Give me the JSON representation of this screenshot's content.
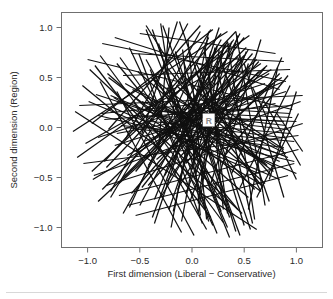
{
  "figure": {
    "background_color": "#ffffff",
    "line_color": "#101010",
    "frame_color": "#6f6f6f",
    "label_color": "#2b2b2b",
    "point_label_color": "#8d8d8d"
  },
  "chart_data": {
    "type": "line",
    "title": "",
    "subtitle": "",
    "xlabel": "First dimension (Liberal − Conservative)",
    "ylabel": "Second dimension (Region)",
    "xlim": [
      -1.25,
      1.25
    ],
    "ylim": [
      -1.2,
      1.15
    ],
    "xticks": [
      -1.0,
      -0.5,
      0.0,
      0.5,
      1.0
    ],
    "xticklabels": [
      "−1.0",
      "−0.5",
      "0.0",
      "0.5",
      "1.0"
    ],
    "yticks": [
      -1.0,
      -0.5,
      0.0,
      0.5,
      1.0
    ],
    "yticklabels": [
      "−1.0",
      "−0.5",
      "0.0",
      "0.5",
      "1.0"
    ],
    "grid": false,
    "legend": false,
    "legend_position": "none",
    "annotations": [
      {
        "text": "R",
        "x": 0.16,
        "y": 0.07,
        "color": "#8d8d8d"
      }
    ],
    "series_description": "Dense bundle of straight line segments (respondent cutting lines) crossing the unit region, densest near the origin and thinning toward the corners.",
    "n_segments": 150,
    "segments": [
      [
        -1.12,
        0.16,
        0.62,
        -1.02
      ],
      [
        -1.1,
        -0.3,
        0.55,
        0.92
      ],
      [
        -0.98,
        0.58,
        0.48,
        -0.86
      ],
      [
        -0.95,
        -0.52,
        0.74,
        0.54
      ],
      [
        -0.92,
        0.33,
        0.88,
        -0.28
      ],
      [
        -0.9,
        -0.1,
        0.7,
        0.44
      ],
      [
        -0.88,
        0.72,
        0.3,
        -0.95
      ],
      [
        -0.86,
        -0.62,
        0.52,
        0.8
      ],
      [
        -0.84,
        0.08,
        0.96,
        0.22
      ],
      [
        -0.82,
        -0.4,
        0.42,
        0.96
      ],
      [
        -0.8,
        0.5,
        0.66,
        -0.64
      ],
      [
        -0.78,
        -0.7,
        0.18,
        0.98
      ],
      [
        -0.76,
        0.2,
        0.84,
        -0.52
      ],
      [
        -0.74,
        -0.18,
        0.9,
        0.36
      ],
      [
        -0.72,
        0.64,
        0.44,
        -0.82
      ],
      [
        -0.7,
        -0.56,
        0.62,
        0.68
      ],
      [
        -0.68,
        0.02,
        0.98,
        -0.14
      ],
      [
        -0.66,
        -0.86,
        0.28,
        0.88
      ],
      [
        -0.64,
        0.44,
        0.8,
        -0.4
      ],
      [
        -0.62,
        -0.28,
        0.76,
        0.58
      ],
      [
        -0.6,
        0.8,
        0.2,
        -0.98
      ],
      [
        -0.58,
        -0.66,
        0.58,
        0.74
      ],
      [
        -0.56,
        0.12,
        1.0,
        0.06
      ],
      [
        -0.54,
        -0.44,
        0.5,
        0.9
      ],
      [
        -0.52,
        0.56,
        0.7,
        -0.56
      ],
      [
        -0.5,
        -0.78,
        0.34,
        0.86
      ],
      [
        -0.48,
        0.26,
        0.92,
        -0.3
      ],
      [
        -0.46,
        -0.14,
        0.88,
        0.46
      ],
      [
        -0.44,
        0.68,
        0.38,
        -0.88
      ],
      [
        -0.42,
        -0.58,
        0.64,
        0.66
      ],
      [
        -0.4,
        0.06,
        0.94,
        -0.06
      ],
      [
        -0.38,
        -0.9,
        0.24,
        0.82
      ],
      [
        -0.36,
        0.48,
        0.78,
        -0.44
      ],
      [
        -0.34,
        -0.32,
        0.72,
        0.62
      ],
      [
        -0.32,
        0.84,
        0.16,
        -0.94
      ],
      [
        -0.3,
        -0.7,
        0.54,
        0.78
      ],
      [
        -0.28,
        0.16,
        0.96,
        0.1
      ],
      [
        -0.26,
        -0.48,
        0.46,
        0.94
      ],
      [
        -0.24,
        0.6,
        0.68,
        -0.6
      ],
      [
        -0.22,
        -0.82,
        0.32,
        0.84
      ],
      [
        -0.2,
        0.3,
        0.9,
        -0.26
      ],
      [
        -0.18,
        -0.22,
        0.86,
        0.5
      ],
      [
        -0.16,
        0.76,
        0.36,
        -0.9
      ],
      [
        -0.14,
        -0.62,
        0.6,
        0.7
      ],
      [
        -0.12,
        0.1,
        0.92,
        -0.02
      ],
      [
        -0.1,
        -0.94,
        0.22,
        0.8
      ],
      [
        -0.08,
        0.52,
        0.76,
        -0.48
      ],
      [
        -0.06,
        -0.36,
        0.7,
        0.6
      ],
      [
        -0.04,
        0.88,
        0.14,
        -0.92
      ],
      [
        -0.02,
        -0.74,
        0.52,
        0.76
      ],
      [
        0.0,
        0.2,
        0.94,
        0.14
      ],
      [
        0.02,
        -0.52,
        0.44,
        0.92
      ],
      [
        0.04,
        0.64,
        0.66,
        -0.64
      ],
      [
        0.06,
        -0.86,
        0.3,
        0.82
      ],
      [
        0.08,
        0.34,
        0.88,
        -0.22
      ],
      [
        0.1,
        -0.26,
        0.84,
        0.54
      ],
      [
        0.12,
        0.8,
        0.34,
        -0.86
      ],
      [
        -1.05,
        0.42,
        0.3,
        -0.74
      ],
      [
        -1.02,
        -0.16,
        0.44,
        0.7
      ],
      [
        -0.99,
        0.26,
        0.64,
        -0.46
      ],
      [
        -0.96,
        -0.44,
        0.36,
        0.84
      ],
      [
        -0.93,
        0.62,
        0.18,
        -0.9
      ],
      [
        -0.9,
        -0.74,
        0.46,
        0.58
      ],
      [
        -0.87,
        0.14,
        0.72,
        0.3
      ],
      [
        -0.84,
        -0.34,
        0.28,
        0.94
      ],
      [
        -0.81,
        0.54,
        0.54,
        -0.7
      ],
      [
        -0.78,
        -0.64,
        0.08,
        0.96
      ],
      [
        -0.75,
        0.3,
        0.68,
        -0.58
      ],
      [
        -0.72,
        -0.06,
        0.8,
        0.24
      ],
      [
        -0.69,
        0.7,
        0.32,
        -0.78
      ],
      [
        -0.66,
        -0.5,
        0.5,
        0.72
      ],
      [
        -0.63,
        0.0,
        0.88,
        -0.2
      ],
      [
        -0.6,
        -0.8,
        0.16,
        0.9
      ],
      [
        -0.57,
        0.38,
        0.7,
        -0.36
      ],
      [
        -0.54,
        -0.24,
        0.66,
        0.64
      ],
      [
        -0.51,
        0.74,
        0.1,
        -0.96
      ],
      [
        -0.48,
        -0.6,
        0.48,
        0.68
      ],
      [
        -0.45,
        0.18,
        0.9,
        0.02
      ],
      [
        -0.42,
        -0.38,
        0.4,
        0.88
      ],
      [
        -0.39,
        0.5,
        0.6,
        -0.62
      ],
      [
        -0.36,
        -0.72,
        0.24,
        0.8
      ],
      [
        -0.33,
        0.22,
        0.84,
        -0.34
      ],
      [
        -0.3,
        -0.08,
        0.78,
        0.4
      ],
      [
        -0.27,
        0.62,
        0.28,
        -0.84
      ],
      [
        -0.24,
        -0.54,
        0.56,
        0.6
      ],
      [
        -0.21,
        0.04,
        0.86,
        -0.1
      ],
      [
        -0.18,
        -0.84,
        0.18,
        0.76
      ],
      [
        -0.15,
        0.42,
        0.72,
        -0.38
      ],
      [
        -0.12,
        -0.3,
        0.64,
        0.56
      ],
      [
        -0.09,
        0.78,
        0.08,
        -0.88
      ],
      [
        -0.06,
        -0.66,
        0.46,
        0.72
      ],
      [
        -0.03,
        0.12,
        0.88,
        0.06
      ],
      [
        0.0,
        -0.42,
        0.38,
        0.86
      ],
      [
        0.03,
        0.56,
        0.62,
        -0.54
      ],
      [
        0.06,
        -0.76,
        0.26,
        0.78
      ],
      [
        0.09,
        0.28,
        0.82,
        -0.2
      ],
      [
        0.12,
        -0.18,
        0.78,
        0.44
      ],
      [
        0.15,
        0.7,
        0.3,
        -0.82
      ],
      [
        0.18,
        -0.56,
        0.54,
        0.64
      ],
      [
        -0.96,
        0.04,
        0.2,
        0.98
      ],
      [
        -0.88,
        0.46,
        -0.1,
        -1.05
      ],
      [
        -0.8,
        -0.02,
        0.08,
        1.02
      ],
      [
        -0.72,
        0.36,
        0.02,
        -1.08
      ],
      [
        -0.64,
        -0.12,
        -0.04,
        1.04
      ],
      [
        -0.56,
        0.26,
        0.14,
        -1.02
      ],
      [
        -0.48,
        -0.06,
        -0.14,
        1.06
      ],
      [
        -0.4,
        0.58,
        0.24,
        -1.06
      ],
      [
        -0.32,
        -0.2,
        -0.22,
        1.0
      ],
      [
        -0.24,
        0.4,
        0.34,
        -1.0
      ],
      [
        -0.16,
        0.08,
        -0.3,
        1.04
      ],
      [
        -0.08,
        0.66,
        0.42,
        -1.04
      ],
      [
        0.0,
        -0.16,
        -0.38,
        0.98
      ],
      [
        0.08,
        0.48,
        0.5,
        -0.98
      ],
      [
        0.16,
        0.02,
        -0.44,
        1.02
      ],
      [
        0.24,
        0.6,
        0.58,
        -0.96
      ],
      [
        -1.08,
        0.22,
        1.06,
        0.32
      ],
      [
        -1.04,
        -0.36,
        1.02,
        -0.08
      ],
      [
        -1.0,
        0.68,
        0.96,
        0.18
      ],
      [
        -0.94,
        -0.48,
        1.04,
        0.26
      ],
      [
        -0.9,
        0.12,
        0.98,
        -0.34
      ],
      [
        -0.86,
        0.84,
        0.9,
        0.46
      ],
      [
        -0.82,
        -0.58,
        1.06,
        0.04
      ],
      [
        -0.78,
        0.32,
        1.0,
        -0.46
      ],
      [
        -0.74,
        0.9,
        0.84,
        0.38
      ],
      [
        -0.7,
        -0.68,
        1.02,
        -0.22
      ],
      [
        -0.66,
        0.52,
        0.94,
        0.58
      ],
      [
        -0.62,
        -0.78,
        0.98,
        -0.36
      ],
      [
        -0.58,
        0.74,
        0.88,
        0.66
      ],
      [
        -0.54,
        -0.88,
        0.92,
        -0.48
      ],
      [
        -0.5,
        0.94,
        0.8,
        0.74
      ],
      [
        0.2,
        -0.68,
        0.66,
        0.88
      ],
      [
        0.26,
        0.72,
        0.74,
        -0.74
      ],
      [
        0.3,
        -0.3,
        0.92,
        0.52
      ],
      [
        0.34,
        0.86,
        0.6,
        -0.92
      ],
      [
        0.38,
        -0.46,
        0.86,
        0.7
      ],
      [
        0.42,
        0.96,
        0.7,
        -0.78
      ],
      [
        0.46,
        -0.6,
        0.94,
        0.42
      ],
      [
        0.5,
        0.64,
        0.88,
        -0.7
      ],
      [
        0.54,
        -0.82,
        0.82,
        0.6
      ],
      [
        0.58,
        0.4,
        1.0,
        -0.52
      ],
      [
        -0.44,
        0.98,
        0.36,
        -1.1
      ],
      [
        -0.36,
        -0.96,
        0.26,
        1.0
      ],
      [
        -0.28,
        1.02,
        0.46,
        -1.08
      ],
      [
        -0.2,
        -1.0,
        0.16,
        0.96
      ],
      [
        -0.12,
        1.06,
        0.56,
        -1.02
      ],
      [
        0.62,
        -0.7,
        1.02,
        0.14
      ],
      [
        0.68,
        0.28,
        1.04,
        -0.38
      ],
      [
        0.74,
        -0.52,
        1.0,
        0.36
      ],
      [
        0.8,
        0.16,
        1.06,
        -0.24
      ],
      [
        -1.14,
        -0.04,
        0.34,
        0.96
      ]
    ]
  },
  "axes": {
    "x_title": "First dimension (Liberal − Conservative)",
    "y_title": "Second dimension (Region)"
  }
}
